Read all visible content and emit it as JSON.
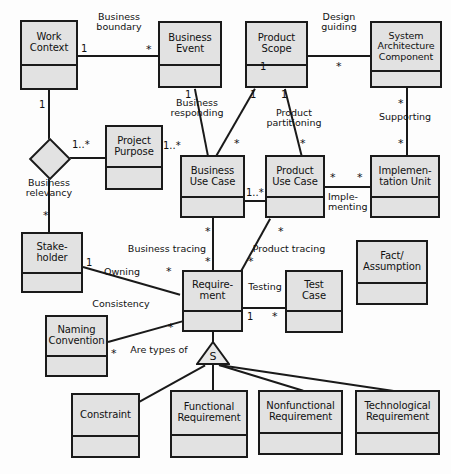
{
  "diagram": {
    "type": "uml-class-diagram",
    "canvas": {
      "width": 451,
      "height": 474
    },
    "style": {
      "box_fill": "#e2e2e2",
      "box_border": "#1a1a1a",
      "line_color": "#1a1a1a",
      "background": "#fdfdfd"
    },
    "classes": [
      {
        "id": "work_context",
        "name": "Work\nContext",
        "x": 20,
        "y": 20,
        "w": 58,
        "h": 70,
        "header_h": 40
      },
      {
        "id": "business_event",
        "name": "Business\nEvent",
        "x": 158,
        "y": 21,
        "w": 64,
        "h": 67,
        "header_h": 39
      },
      {
        "id": "product_scope",
        "name": "Product\nScope",
        "x": 245,
        "y": 21,
        "w": 63,
        "h": 67,
        "header_h": 39
      },
      {
        "id": "system_arch_comp",
        "name": "System\nArchitecture\nComponent",
        "x": 370,
        "y": 21,
        "w": 72,
        "h": 67,
        "header_h": 45
      },
      {
        "id": "project_purpose",
        "name": "Project\nPurpose",
        "x": 105,
        "y": 125,
        "w": 58,
        "h": 65,
        "header_h": 37
      },
      {
        "id": "business_use_case",
        "name": "Business\nUse Case",
        "x": 180,
        "y": 155,
        "w": 65,
        "h": 63,
        "header_h": 37
      },
      {
        "id": "product_use_case",
        "name": "Product\nUse Case",
        "x": 265,
        "y": 155,
        "w": 60,
        "h": 63,
        "header_h": 37
      },
      {
        "id": "implementation_unit",
        "name": "Implemen-\ntation Unit",
        "x": 370,
        "y": 155,
        "w": 70,
        "h": 63,
        "header_h": 37
      },
      {
        "id": "stakeholder",
        "name": "Stake-\nholder",
        "x": 21,
        "y": 232,
        "w": 62,
        "h": 61,
        "header_h": 36
      },
      {
        "id": "requirement",
        "name": "Require-\nment",
        "x": 182,
        "y": 270,
        "w": 61,
        "h": 62,
        "header_h": 36
      },
      {
        "id": "test_case",
        "name": "Test\nCase",
        "x": 285,
        "y": 270,
        "w": 58,
        "h": 63,
        "header_h": 36
      },
      {
        "id": "fact_assumption",
        "name": "Fact/\nAssumption",
        "x": 356,
        "y": 240,
        "w": 72,
        "h": 65,
        "header_h": 38
      },
      {
        "id": "naming_convention",
        "name": "Naming\nConvention",
        "x": 45,
        "y": 315,
        "w": 63,
        "h": 62,
        "header_h": 36
      },
      {
        "id": "constraint",
        "name": "Constraint",
        "x": 71,
        "y": 393,
        "w": 69,
        "h": 65,
        "header_h": 38
      },
      {
        "id": "functional_req",
        "name": "Functional\nRequirement",
        "x": 170,
        "y": 390,
        "w": 78,
        "h": 68,
        "header_h": 40
      },
      {
        "id": "nonfunctional_req",
        "name": "Nonfunctional\nRequirement",
        "x": 258,
        "y": 390,
        "w": 85,
        "h": 65,
        "header_h": 38
      },
      {
        "id": "technological_req",
        "name": "Technological\nRequirement",
        "x": 355,
        "y": 390,
        "w": 85,
        "h": 65,
        "header_h": 38
      }
    ],
    "associations": [
      {
        "id": "business_boundary",
        "label": "Business\nboundary",
        "from": "work_context",
        "to": "business_event",
        "from_mult": "1",
        "to_mult": "*"
      },
      {
        "id": "design_guiding",
        "label": "Design\nguiding",
        "from": "product_scope",
        "to": "system_arch_comp",
        "from_mult": "1",
        "to_mult": "*"
      },
      {
        "id": "business_relevancy",
        "label": "Business\nrelevancy",
        "from": "work_context",
        "to": "stakeholder",
        "from_mult": "1",
        "to_mult": "*",
        "aggregation": true,
        "branch_mult": "1..*",
        "branch_to": "project_purpose"
      },
      {
        "id": "business_responding",
        "label": "Business\nresponding",
        "from": "business_event",
        "to": "business_use_case",
        "from_mult": "1",
        "to_mult": "1..*"
      },
      {
        "id": "product_partitioning",
        "label": "Product\npartitioning",
        "from": "product_scope",
        "to": "product_use_case",
        "from_mult": "1",
        "to_mult": "*"
      },
      {
        "id": "product_scope_buc",
        "label": "",
        "from": "product_scope",
        "to": "business_use_case",
        "from_mult": "1",
        "to_mult": "*"
      },
      {
        "id": "supporting",
        "label": "Supporting",
        "from": "system_arch_comp",
        "to": "implementation_unit",
        "from_mult": "*",
        "to_mult": "*"
      },
      {
        "id": "implementing",
        "label": "Imple-\nmenting",
        "from": "product_use_case",
        "to": "implementation_unit",
        "from_mult": "*",
        "to_mult": "*"
      },
      {
        "id": "buc_puc",
        "label": "",
        "from": "business_use_case",
        "to": "product_use_case",
        "from_mult": "",
        "to_mult": "1..*"
      },
      {
        "id": "business_tracing",
        "label": "Business tracing",
        "from": "business_use_case",
        "to": "requirement",
        "from_mult": "*",
        "to_mult": "*"
      },
      {
        "id": "product_tracing",
        "label": "Product tracing",
        "from": "product_use_case",
        "to": "requirement",
        "from_mult": "*",
        "to_mult": "*"
      },
      {
        "id": "owning",
        "label": "Owning",
        "from": "stakeholder",
        "to": "requirement",
        "from_mult": "1",
        "to_mult": "*"
      },
      {
        "id": "consistency",
        "label": "Consistency",
        "from": "naming_convention",
        "to": "requirement",
        "from_mult": "*",
        "to_mult": "*"
      },
      {
        "id": "testing",
        "label": "Testing",
        "from": "requirement",
        "to": "test_case",
        "from_mult": "1",
        "to_mult": "*"
      }
    ],
    "generalization": {
      "id": "are_types_of",
      "label": "Are types of",
      "marker": "S",
      "parent": "requirement",
      "children": [
        "constraint",
        "functional_req",
        "nonfunctional_req",
        "technological_req"
      ]
    },
    "labels": {
      "business_boundary": "Business\nboundary",
      "design_guiding": "Design\nguiding",
      "business_responding": "Business\nresponding",
      "product_partitioning": "Product\npartitioning",
      "supporting": "Supporting",
      "implementing": "Imple-\nmenting",
      "business_relevancy": "Business\nrelevancy",
      "business_tracing": "Business tracing",
      "product_tracing": "Product tracing",
      "owning": "Owning",
      "consistency": "Consistency",
      "testing": "Testing",
      "are_types_of": "Are types of",
      "gen_marker": "S"
    },
    "multiplicities": {
      "wc_1": "1",
      "be_star": "*",
      "ps_1": "1",
      "sac_star": "*",
      "wc_bottom_1": "1",
      "pp_1star": "1..*",
      "stakeholder_star": "*",
      "be_bottom_1": "1",
      "buc_top_1star": "1..*",
      "ps_left_1": "1",
      "buc_star": "*",
      "ps_right_1": "1",
      "puc_star": "*",
      "sac_bottom_star": "*",
      "iu_top_star": "*",
      "puc_right_star": "*",
      "iu_left_star": "*",
      "buc_right_1star": "1..*",
      "buc_bottom_star": "*",
      "req_top_star": "*",
      "puc_bottom_star": "*",
      "req_topright_star": "*",
      "sh_1": "1",
      "req_left_star": "*",
      "nc_star": "*",
      "req_lowleft_star": "*",
      "req_1": "1",
      "tc_star": "*"
    }
  }
}
